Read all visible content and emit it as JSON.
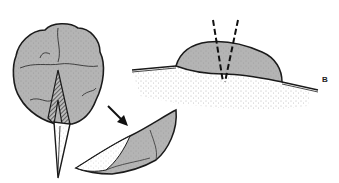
{
  "figure": {
    "panel_label": "B",
    "colors": {
      "fill_gray": "#b4b4b4",
      "outline": "#1a1a1a",
      "stipple": "#555555",
      "background": "#ffffff"
    },
    "elements": [
      {
        "name": "lobulated-mass-with-wedge-incision",
        "description": "Rounded lobulated gray mass with hatched wedge and a pointed blade-shaped segment extending downward"
      },
      {
        "name": "arrow",
        "description": "Black arrow pointing down-right toward excised wedge"
      },
      {
        "name": "excised-wedge-specimen",
        "description": "Elongated boat-shaped excised tissue segment, partly gray and partly stippled"
      },
      {
        "name": "cross-section-mound",
        "description": "Gray dome-shaped lesion raised above skin surface with stippled subcutaneous tissue below"
      },
      {
        "name": "incision-lines",
        "description": "Two dashed lines converging into a V below the mound"
      }
    ]
  }
}
